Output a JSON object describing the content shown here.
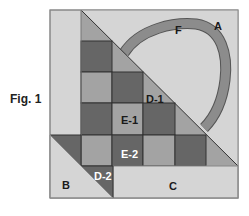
{
  "figure": {
    "caption": "Fig. 1",
    "colors": {
      "background_light": "#d5d5d5",
      "medium": "#a3a3a3",
      "dark": "#666666",
      "arc": "#8c8c8c",
      "outline": "#333333",
      "label_dark": "#1a1a1a",
      "label_light": "#ffffff"
    },
    "labels": {
      "A": "A",
      "B": "B",
      "C": "C",
      "D1": "D-1",
      "D2": "D-2",
      "E1": "E-1",
      "E2": "E-2",
      "F": "F"
    }
  }
}
